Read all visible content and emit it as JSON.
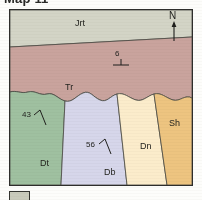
{
  "figure": {
    "caption_partial": "Map 11",
    "kind": "geologic-map"
  },
  "map": {
    "north_arrow": {
      "letter": "N",
      "icon": "north-arrow-icon"
    },
    "units": [
      {
        "code": "Jrt",
        "color": "#d3d4c6",
        "label_x": 74,
        "label_y": 12
      },
      {
        "code": "Tr",
        "color": "#c9a39d",
        "label_x": 60,
        "label_y": 78
      },
      {
        "code": "Dt",
        "color": "#9fc0a0",
        "label_x": 35,
        "label_y": 155
      },
      {
        "code": "Db",
        "color": "#d6d6ea",
        "label_x": 100,
        "label_y": 163
      },
      {
        "code": "Dn",
        "color": "#fbeccb",
        "label_x": 138,
        "label_y": 140
      },
      {
        "code": "Sh",
        "color": "#edc480",
        "label_x": 170,
        "label_y": 118
      }
    ],
    "strike_dip_measurements": [
      {
        "value": "6",
        "x": 106,
        "y": 47,
        "rotation": 0,
        "symbol": "strike-dip-symbol"
      },
      {
        "value": "43",
        "x": 15,
        "y": 110,
        "rotation": -28,
        "symbol": "strike-dip-symbol"
      },
      {
        "value": "56",
        "x": 78,
        "y": 140,
        "rotation": -28,
        "symbol": "strike-dip-symbol"
      }
    ]
  },
  "legend": {
    "swatch_color": "#c9cabb",
    "swatch_label": ""
  }
}
